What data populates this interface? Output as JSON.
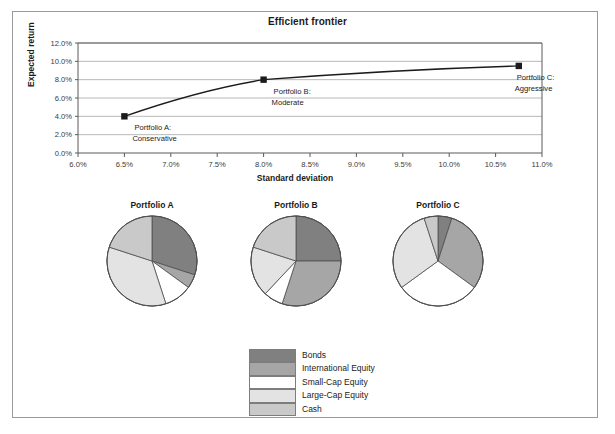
{
  "figure": {
    "title": "Efficient frontier",
    "border_color": "#9a9a9a",
    "background": "#ffffff"
  },
  "chart_data": [
    {
      "type": "line",
      "title": "Efficient frontier",
      "xlabel": "Standard deviation",
      "ylabel": "Expected return",
      "xlim": [
        6.0,
        11.0
      ],
      "ylim": [
        0.0,
        12.0
      ],
      "xtick_labels": [
        "6.0%",
        "6.5%",
        "7.0%",
        "7.5%",
        "8.0%",
        "8.5%",
        "9.0%",
        "9.5%",
        "10.0%",
        "10.5%",
        "11.0%"
      ],
      "xticks": [
        6.0,
        6.5,
        7.0,
        7.5,
        8.0,
        8.5,
        9.0,
        9.5,
        10.0,
        10.5,
        11.0
      ],
      "ytick_labels": [
        "0.0%",
        "2.0%",
        "4.0%",
        "6.0%",
        "8.0%",
        "10.0%",
        "12.0%"
      ],
      "yticks": [
        0.0,
        2.0,
        4.0,
        6.0,
        8.0,
        10.0,
        12.0
      ],
      "grid": "horizontal",
      "legend": "none",
      "line_color": "#1b1b1b",
      "marker": "square",
      "x": [
        6.5,
        8.0,
        10.75
      ],
      "y": [
        4.0,
        8.0,
        9.5
      ],
      "points": [
        {
          "label": "Portfolio A:",
          "sublabel": "Conservative",
          "x": 6.5,
          "y": 4.0
        },
        {
          "label": "Portfolio B:",
          "sublabel": "Moderate",
          "x": 8.0,
          "y": 8.0
        },
        {
          "label": "Portfolio C:",
          "sublabel": "Aggressive",
          "x": 10.75,
          "y": 9.5
        }
      ]
    },
    {
      "type": "pie",
      "title": "Portfolio A",
      "labels": [
        "Bonds",
        "International Equity",
        "Small-Cap Equity",
        "Large-Cap Equity",
        "Cash"
      ],
      "values": [
        30,
        5,
        10,
        35,
        20
      ],
      "colors": [
        "#808080",
        "#a6a6a6",
        "#ffffff",
        "#e3e3e3",
        "#c9c9c9"
      ],
      "start_angle": 90,
      "direction": "clockwise"
    },
    {
      "type": "pie",
      "title": "Portfolio B",
      "labels": [
        "Bonds",
        "International Equity",
        "Small-Cap Equity",
        "Large-Cap Equity",
        "Cash"
      ],
      "values": [
        25,
        30,
        7,
        18,
        20
      ],
      "colors": [
        "#808080",
        "#a6a6a6",
        "#ffffff",
        "#e3e3e3",
        "#c9c9c9"
      ],
      "start_angle": 90,
      "direction": "clockwise"
    },
    {
      "type": "pie",
      "title": "Portfolio C",
      "labels": [
        "Bonds",
        "International Equity",
        "Small-Cap Equity",
        "Large-Cap Equity",
        "Cash"
      ],
      "values": [
        5,
        30,
        30,
        30,
        5
      ],
      "colors": [
        "#808080",
        "#a6a6a6",
        "#ffffff",
        "#e3e3e3",
        "#c9c9c9"
      ],
      "start_angle": 90,
      "direction": "clockwise"
    }
  ],
  "pies": [
    {
      "title": "Portfolio A"
    },
    {
      "title": "Portfolio B"
    },
    {
      "title": "Portfolio C"
    }
  ],
  "legend": {
    "items": [
      {
        "label": "Bonds",
        "color": "#808080"
      },
      {
        "label": "International Equity",
        "color": "#a6a6a6"
      },
      {
        "label": "Small-Cap Equity",
        "color": "#ffffff"
      },
      {
        "label": "Large-Cap Equity",
        "color": "#e3e3e3"
      },
      {
        "label": "Cash",
        "color": "#c9c9c9"
      }
    ]
  },
  "axes": {
    "x_title": "Standard deviation",
    "y_title": "Expected return"
  }
}
